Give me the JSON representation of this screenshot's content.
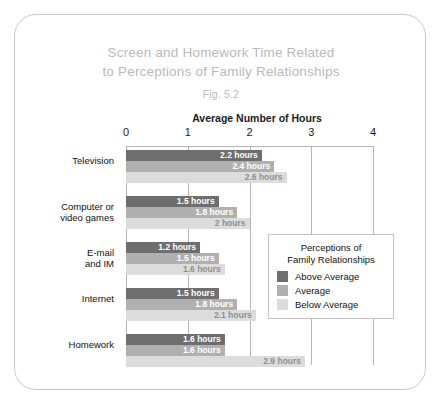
{
  "figure": {
    "title_line_1": "Screen and Homework Time Related",
    "title_line_2": "to Perceptions of Family Relationships",
    "fig_number": "Fig. 5.2"
  },
  "legend": {
    "title_line_1": "Perceptions of",
    "title_line_2": "Family Relationships",
    "entries": [
      {
        "label": "Above Average",
        "color": "#6e6e6e"
      },
      {
        "label": "Average",
        "color": "#b0b0b0"
      },
      {
        "label": "Below Average",
        "color": "#dcdcdc"
      }
    ]
  },
  "chart_data": {
    "type": "bar",
    "orientation": "horizontal",
    "title": "Screen and Homework Time Related to Perceptions of Family Relationships",
    "subtitle": "Fig. 5.2",
    "xlabel": "Average Number of Hours",
    "ylabel": "",
    "xlim": [
      0,
      4
    ],
    "xticks": [
      "0",
      "1",
      "2",
      "3",
      "4"
    ],
    "grid": true,
    "legend_position": "inside-right",
    "categories": [
      "Television",
      "Computer or video games",
      "E-mail and IM",
      "Internet",
      "Homework"
    ],
    "category_label_lines": [
      [
        "Television"
      ],
      [
        "Computer or",
        "video games"
      ],
      [
        "E-mail",
        "and IM"
      ],
      [
        "Internet"
      ],
      [
        "Homework"
      ]
    ],
    "series": [
      {
        "name": "Above Average",
        "color": "#6e6e6e",
        "values": [
          2.2,
          1.5,
          1.2,
          1.5,
          1.6
        ],
        "labels": [
          "2.2 hours",
          "1.5 hours",
          "1.2 hours",
          "1.5 hours",
          "1.6 hours"
        ]
      },
      {
        "name": "Average",
        "color": "#b0b0b0",
        "values": [
          2.4,
          1.8,
          1.5,
          1.8,
          1.6
        ],
        "labels": [
          "2.4 hours",
          "1.8 hours",
          "1.5 hours",
          "1.8 hours",
          "1.6 hours"
        ]
      },
      {
        "name": "Below Average",
        "color": "#dcdcdc",
        "values": [
          2.6,
          2.0,
          1.6,
          2.1,
          2.9
        ],
        "labels": [
          "2.6 hours",
          "2 hours",
          "1.6 hours",
          "2.1 hours",
          "2.9 hours"
        ]
      }
    ]
  }
}
